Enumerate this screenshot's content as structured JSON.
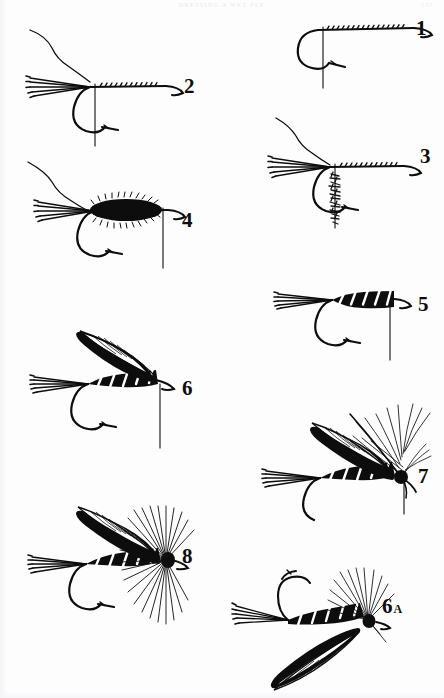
{
  "page": {
    "running_head": "DRESSING A WET FLY",
    "folio": "135",
    "background_color": "#fdfdfd",
    "ink_color": "#0d0d0d"
  },
  "diagram": {
    "type": "instructional-illustration-plate",
    "step_count": 9,
    "steps": [
      {
        "label": "1",
        "name": "bare-hook-with-thread",
        "description": "Hook in vise with tying thread started and wound along the shank",
        "position": {
          "x": 296,
          "y": 14,
          "w": 140,
          "h": 76
        },
        "label_pos": {
          "x": 416,
          "y": 18
        },
        "has_tail": false,
        "has_body": false,
        "has_rib": false,
        "has_wing": false,
        "has_hackle": false
      },
      {
        "label": "2",
        "name": "tail-fibers-tied-in",
        "description": "Tail fibers tied in at the bend, thread hanging from bobbin",
        "position": {
          "x": 14,
          "y": 26,
          "w": 180,
          "h": 122
        },
        "label_pos": {
          "x": 184,
          "y": 76
        },
        "has_tail": true,
        "has_body": false,
        "has_rib": false,
        "has_wing": false,
        "has_hackle": false
      },
      {
        "label": "3",
        "name": "dubbing-spun-on-thread",
        "description": "Dubbing material spun onto the hanging tying thread",
        "position": {
          "x": 250,
          "y": 116,
          "w": 182,
          "h": 112
        },
        "label_pos": {
          "x": 420,
          "y": 146
        },
        "has_tail": true,
        "has_body": false,
        "has_rib": false,
        "has_wing": false,
        "has_hackle": false
      },
      {
        "label": "4",
        "name": "dubbed-body-wound",
        "description": "Dubbed fur body wound forward along the shank",
        "position": {
          "x": 22,
          "y": 156,
          "w": 186,
          "h": 112
        },
        "label_pos": {
          "x": 182,
          "y": 210
        },
        "has_tail": true,
        "has_body": true,
        "has_rib": false,
        "has_wing": false,
        "has_hackle": false
      },
      {
        "label": "5",
        "name": "ribbed-body",
        "description": "Body ribbed with tinsel in open spirals",
        "position": {
          "x": 266,
          "y": 276,
          "w": 170,
          "h": 84
        },
        "label_pos": {
          "x": 418,
          "y": 294
        },
        "has_tail": true,
        "has_body": true,
        "has_rib": true,
        "has_wing": false,
        "has_hackle": false
      },
      {
        "label": "6",
        "name": "wing-tied-in",
        "description": "Matched quill slip wing tied in over the body",
        "position": {
          "x": 24,
          "y": 322,
          "w": 180,
          "h": 126
        },
        "label_pos": {
          "x": 182,
          "y": 378
        },
        "has_tail": true,
        "has_body": true,
        "has_rib": true,
        "has_wing": true,
        "has_hackle": false
      },
      {
        "label": "7",
        "name": "hackle-tied-in",
        "description": "Soft hackle feather tied in at the head before wrapping",
        "position": {
          "x": 258,
          "y": 378,
          "w": 180,
          "h": 136
        },
        "label_pos": {
          "x": 418,
          "y": 466
        },
        "has_tail": true,
        "has_body": true,
        "has_rib": true,
        "has_wing": true,
        "has_hackle": true
      },
      {
        "label": "8",
        "name": "finished-wet-fly",
        "description": "Completed wet fly with hackle wound and head whip finished",
        "position": {
          "x": 24,
          "y": 500,
          "w": 180,
          "h": 126
        },
        "label_pos": {
          "x": 182,
          "y": 546
        },
        "has_tail": true,
        "has_body": true,
        "has_rib": true,
        "has_wing": true,
        "has_hackle": true
      },
      {
        "label": "6",
        "label_suffix": "A",
        "name": "wing-alternate-view",
        "description": "Alternate view of step 6 showing the fly inverted, hook point up",
        "position": {
          "x": 228,
          "y": 566,
          "w": 176,
          "h": 126
        },
        "label_pos": {
          "x": 382,
          "y": 596
        },
        "has_tail": true,
        "has_body": true,
        "has_rib": true,
        "has_wing": true,
        "has_hackle": true,
        "inverted": true
      }
    ]
  }
}
